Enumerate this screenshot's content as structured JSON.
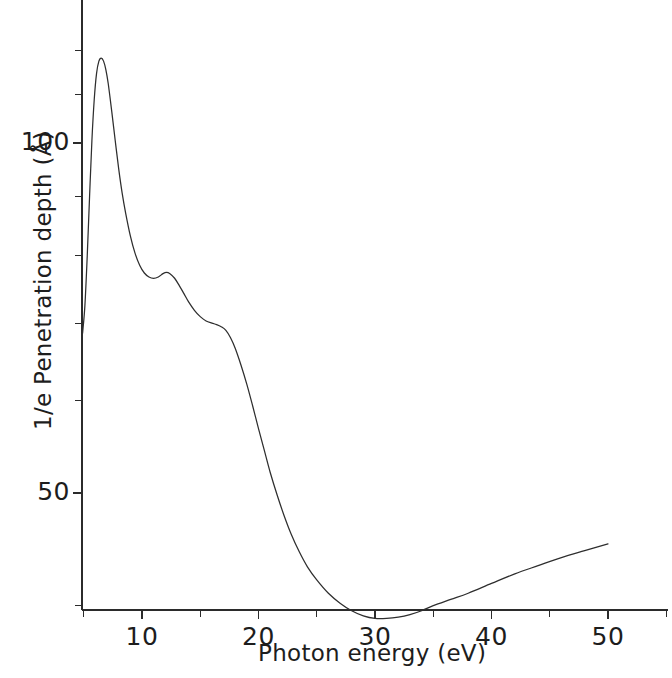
{
  "figure": {
    "background_color": "#ffffff",
    "line_color": "#2e2e2e",
    "text_color": "#1d1d1d"
  },
  "chart_data": {
    "type": "line",
    "title": "",
    "xlabel": "Photon energy (eV)",
    "ylabel": "1/e Penetration depth (Å)",
    "grid": false,
    "legend": null,
    "xscale": "linear",
    "yscale": "log",
    "xlim": [
      4.6,
      55.0
    ],
    "ylim": [
      36.0,
      128.0
    ],
    "x_major_ticks": [
      10,
      20,
      30,
      40,
      50
    ],
    "x_major_tick_labels": [
      "10",
      "20",
      "30",
      "40",
      "50"
    ],
    "x_minor_ticks": [
      5,
      15,
      25,
      35,
      45,
      55
    ],
    "y_major_ticks": [
      50,
      100
    ],
    "y_major_tick_labels": [
      "50",
      "100"
    ],
    "y_minor_ticks": [
      40,
      60,
      70,
      80,
      90,
      110,
      120
    ],
    "series": [
      {
        "name": "1/e penetration depth",
        "x": [
          4.9,
          5.1,
          5.3,
          5.5,
          5.7,
          5.9,
          6.1,
          6.3,
          6.5,
          6.7,
          6.9,
          7.1,
          7.4,
          7.7,
          8.0,
          8.3,
          8.6,
          9.0,
          9.4,
          9.8,
          10.2,
          10.6,
          11.0,
          11.4,
          11.8,
          12.1,
          12.4,
          12.8,
          13.2,
          13.6,
          14.0,
          14.5,
          15.0,
          15.5,
          16.0,
          16.4,
          16.8,
          17.2,
          17.6,
          18.0,
          18.5,
          19.0,
          19.5,
          20.0,
          20.5,
          21.0,
          21.6,
          22.2,
          22.8,
          23.5,
          24.2,
          25.0,
          26.0,
          27.0,
          28.0,
          29.0,
          30.0,
          31.0,
          32.0,
          33.0,
          34.0,
          35.0,
          36.5,
          38.0,
          40.0,
          42.0,
          44.0,
          46.0,
          48.0,
          50.0
        ],
        "y": [
          68.6,
          72.5,
          80.0,
          90.0,
          100.5,
          109.0,
          114.8,
          117.6,
          118.3,
          117.6,
          115.6,
          112.5,
          106.5,
          100.5,
          95.0,
          90.5,
          87.0,
          83.2,
          80.4,
          78.5,
          77.3,
          76.7,
          76.5,
          76.7,
          77.2,
          77.4,
          77.2,
          76.5,
          75.4,
          74.2,
          73.0,
          71.8,
          70.9,
          70.3,
          70.0,
          69.8,
          69.5,
          69.0,
          68.0,
          66.6,
          64.4,
          62.0,
          59.4,
          56.8,
          54.4,
          52.1,
          49.8,
          47.8,
          46.1,
          44.5,
          43.2,
          42.1,
          41.0,
          40.2,
          39.6,
          39.2,
          39.0,
          39.0,
          39.1,
          39.3,
          39.6,
          40.0,
          40.5,
          41.0,
          41.8,
          42.6,
          43.3,
          44.0,
          44.6,
          45.2
        ],
        "units_x": "eV",
        "units_y": "Å"
      }
    ],
    "annotations": {
      "peak": {
        "x": 6.5,
        "y": 118.3
      },
      "shoulder": {
        "x": 12.1,
        "y": 77.4
      },
      "minimum": {
        "x": 30.5,
        "y": 39.0
      },
      "end_value": {
        "x": 50.0,
        "y": 45.2
      },
      "start_value": {
        "x": 4.9,
        "y": 68.6
      }
    }
  },
  "axes": {
    "x_tick_labels": [
      {
        "value": 10,
        "text": "10"
      },
      {
        "value": 20,
        "text": "20"
      },
      {
        "value": 30,
        "text": "30"
      },
      {
        "value": 40,
        "text": "40"
      },
      {
        "value": 50,
        "text": "50"
      }
    ],
    "y_tick_labels": [
      {
        "value": 100,
        "text": "100"
      },
      {
        "value": 50,
        "text": "50"
      }
    ],
    "x_axis_title": "Photon energy (eV)",
    "y_axis_title": "1/e Penetration depth (Å)"
  }
}
